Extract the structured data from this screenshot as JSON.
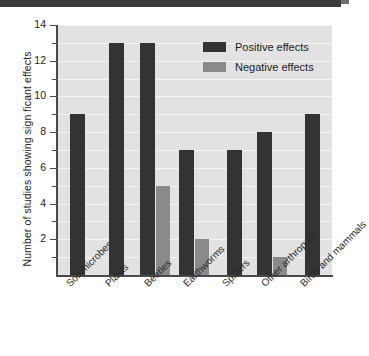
{
  "chart_data": {
    "type": "bar",
    "title": "",
    "xlabel": "",
    "ylabel": "Number of studies showing sign ficant effects",
    "ylim": [
      0,
      14
    ],
    "ytick_labels": [
      "2",
      "4",
      "6",
      "8",
      "10",
      "12",
      "14"
    ],
    "ytick_values": [
      2,
      4,
      6,
      8,
      10,
      12,
      14
    ],
    "minor_tick_values": [
      1,
      3,
      5,
      7,
      9,
      11,
      13
    ],
    "grid": true,
    "grid_axis": "y",
    "legend_position": "top-right",
    "categories": [
      "Soil microbes",
      "Plants",
      "Beetles",
      "Earthworms",
      "Spiders",
      "Other arthropods",
      "Birds and mammals"
    ],
    "series": [
      {
        "name": "Positive effects",
        "color": "#333333",
        "values": [
          9,
          13,
          13,
          7,
          7,
          8,
          9
        ]
      },
      {
        "name": "Negative effects",
        "color": "#8a8a8a",
        "values": [
          0,
          0,
          5,
          2,
          0,
          1,
          0
        ]
      }
    ]
  },
  "colors": {
    "positive": "#333333",
    "negative": "#8a8a8a",
    "plot_background": "#e2e2e2",
    "gridline": "#f4f4f4",
    "axis": "#4a4a4a",
    "text": "#232323"
  }
}
